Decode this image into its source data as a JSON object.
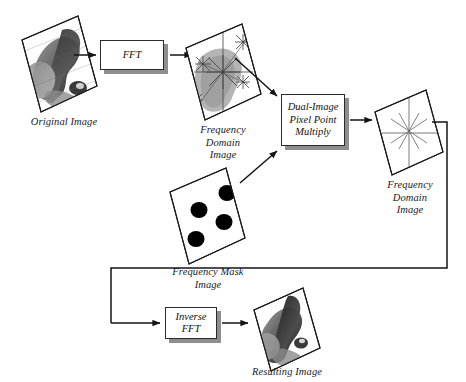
{
  "diagram": {
    "background_color": "#ffffff",
    "line_color": "#1a1a1a",
    "shadow_color": "#8e8e8e",
    "nodes": {
      "original_image": {
        "label": "Original Image",
        "kind": "image-plane",
        "content": "grayscale photographic blob"
      },
      "fft": {
        "label": "FFT",
        "kind": "process-box"
      },
      "frequency_domain_image_1": {
        "label": "Frequency\nDomain\nImage",
        "kind": "image-plane",
        "content": "gray spectrum with star burst artifacts"
      },
      "frequency_mask_image": {
        "label": "Frequency Mask\nImage",
        "kind": "image-plane",
        "content": "white plane with four black dots",
        "dot_count": 4,
        "dot_color": "#000000"
      },
      "dual_image_multiply": {
        "label": "Dual-Image\nPixel Point\nMultiply",
        "kind": "process-box"
      },
      "frequency_domain_image_2": {
        "label": "Frequency\nDomain\nImage",
        "kind": "image-plane",
        "content": "white plane with centered star burst"
      },
      "inverse_fft": {
        "label": "Inverse\nFFT",
        "kind": "process-box"
      },
      "resulting_image": {
        "label": "Resulting Image",
        "kind": "image-plane",
        "content": "grayscale filtered blob"
      }
    },
    "edges": [
      {
        "from": "original_image",
        "to": "fft",
        "style": "arrow-right"
      },
      {
        "from": "fft",
        "to": "frequency_domain_image_1",
        "style": "arrow-right"
      },
      {
        "from": "frequency_domain_image_1",
        "to": "dual_image_multiply",
        "style": "arrow-diagonal-down"
      },
      {
        "from": "frequency_mask_image",
        "to": "dual_image_multiply",
        "style": "arrow-diagonal-up"
      },
      {
        "from": "dual_image_multiply",
        "to": "frequency_domain_image_2",
        "style": "arrow-right"
      },
      {
        "from": "frequency_domain_image_2",
        "to": "inverse_fft",
        "style": "routed-feedback"
      },
      {
        "from": "inverse_fft",
        "to": "resulting_image",
        "style": "arrow-right"
      }
    ]
  }
}
